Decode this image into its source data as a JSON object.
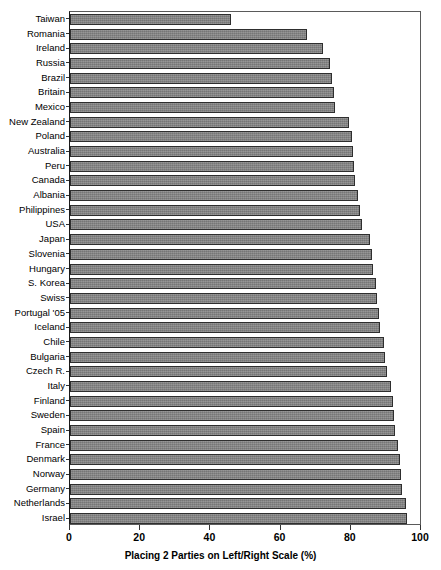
{
  "chart_data": {
    "type": "bar",
    "orientation": "horizontal",
    "title": "",
    "xlabel": "Placing 2 Parties on Left/Right Scale (%)",
    "ylabel": "",
    "xlim": [
      0,
      100
    ],
    "xticks": [
      0,
      20,
      40,
      60,
      80,
      100
    ],
    "xtick_labels": [
      "0",
      "20",
      "40",
      "60",
      "80",
      "100"
    ],
    "grid": false,
    "legend": null,
    "bar_color": "#818181",
    "bar_edge_color": "#2e2e2e",
    "categories": [
      "Taiwan",
      "Romania",
      "Ireland",
      "Russia",
      "Brazil",
      "Britain",
      "Mexico",
      "New Zealand",
      "Poland",
      "Australia",
      "Peru",
      "Canada",
      "Albania",
      "Philippines",
      "USA",
      "Japan",
      "Slovenia",
      "Hungary",
      "S. Korea",
      "Swiss",
      "Portugal '05",
      "Iceland",
      "Chile",
      "Bulgaria",
      "Czech R.",
      "Italy",
      "Finland",
      "Sweden",
      "Spain",
      "France",
      "Denmark",
      "Norway",
      "Germany",
      "Netherlands",
      "Israel"
    ],
    "values": [
      45.9,
      67.5,
      72.1,
      74.2,
      74.6,
      75.2,
      75.5,
      79.5,
      80.4,
      80.7,
      81.0,
      81.3,
      82.1,
      82.6,
      83.2,
      85.5,
      85.9,
      86.4,
      87.3,
      87.6,
      87.9,
      88.3,
      89.4,
      89.8,
      90.2,
      91.5,
      91.9,
      92.2,
      92.5,
      93.4,
      93.9,
      94.3,
      94.6,
      95.7,
      96.0
    ]
  }
}
